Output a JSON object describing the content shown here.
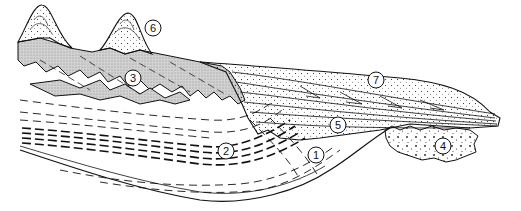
{
  "diagram": {
    "type": "geological cross-section",
    "colors": {
      "ink": "#111111",
      "shaded_unit": "#c8c8c8",
      "background": "#ffffff"
    },
    "labels": [
      {
        "id": "1",
        "text": "1",
        "x": 316,
        "y": 155
      },
      {
        "id": "2",
        "text": "2",
        "x": 226,
        "y": 151
      },
      {
        "id": "3",
        "text": "3",
        "x": 133,
        "y": 78
      },
      {
        "id": "4",
        "text": "4",
        "x": 443,
        "y": 146
      },
      {
        "id": "5",
        "text": "5",
        "x": 338,
        "y": 125
      },
      {
        "id": "6",
        "text": "6",
        "x": 153,
        "y": 28
      },
      {
        "id": "7",
        "text": "7",
        "x": 376,
        "y": 80
      }
    ]
  }
}
